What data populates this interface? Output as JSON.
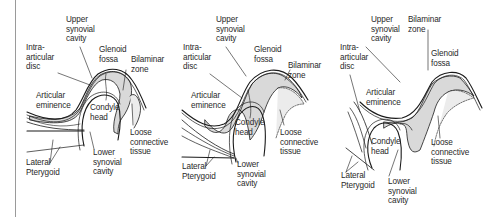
{
  "figure": {
    "panels": [
      {
        "id": "panel-1",
        "labels": [
          {
            "key": "upper_synovial_cavity",
            "lines": [
              "Upper",
              "synovial",
              "cavity"
            ],
            "x": 66,
            "y": 15
          },
          {
            "key": "glenoid_fossa",
            "lines": [
              "Glenoid",
              "fossa"
            ],
            "x": 99,
            "y": 45
          },
          {
            "key": "bilaminar_zone",
            "lines": [
              "Bilaminar",
              "zone"
            ],
            "x": 131,
            "y": 55
          },
          {
            "key": "intra_articular_disc",
            "lines": [
              "Intra-",
              "articular",
              "disc"
            ],
            "x": 26,
            "y": 43
          },
          {
            "key": "articular_eminence",
            "lines": [
              "Articular",
              "eminence"
            ],
            "x": 36,
            "y": 91
          },
          {
            "key": "condyle_head",
            "lines": [
              "Condyle",
              "head"
            ],
            "x": 90,
            "y": 103
          },
          {
            "key": "loose_connective_tissue",
            "lines": [
              "Loose",
              "connective",
              "tissue"
            ],
            "x": 130,
            "y": 128
          },
          {
            "key": "lateral_pterygoid",
            "lines": [
              "Lateral",
              "Pterygoid"
            ],
            "x": 26,
            "y": 158
          },
          {
            "key": "lower_synovial_cavity",
            "lines": [
              "Lower",
              "synovial",
              "cavity"
            ],
            "x": 93,
            "y": 148
          }
        ]
      },
      {
        "id": "panel-2",
        "labels": [
          {
            "key": "upper_synovial_cavity",
            "lines": [
              "Upper",
              "synovial",
              "cavity"
            ],
            "x": 216,
            "y": 15
          },
          {
            "key": "glenoid_fossa",
            "lines": [
              "Glenoid",
              "fossa"
            ],
            "x": 254,
            "y": 45
          },
          {
            "key": "bilaminar_zone",
            "lines": [
              "Bilaminar",
              "zone"
            ],
            "x": 288,
            "y": 61
          },
          {
            "key": "intra_articular_disc",
            "lines": [
              "Intra-",
              "articular",
              "disc"
            ],
            "x": 183,
            "y": 43
          },
          {
            "key": "articular_eminence",
            "lines": [
              "Articular",
              "eminence"
            ],
            "x": 191,
            "y": 91
          },
          {
            "key": "condyle_head",
            "lines": [
              "Condyle",
              "head"
            ],
            "x": 235,
            "y": 118
          },
          {
            "key": "loose_connective_tissue",
            "lines": [
              "Loose",
              "connective",
              "tissue"
            ],
            "x": 280,
            "y": 128
          },
          {
            "key": "lateral_pterygoid",
            "lines": [
              "Lateral",
              "Pterygoid"
            ],
            "x": 182,
            "y": 162
          },
          {
            "key": "lower_synovial_cavity",
            "lines": [
              "Lower",
              "synovial",
              "cavity"
            ],
            "x": 237,
            "y": 160
          }
        ]
      },
      {
        "id": "panel-3",
        "labels": [
          {
            "key": "upper_synovial_cavity",
            "lines": [
              "Upper",
              "synovial",
              "cavity"
            ],
            "x": 371,
            "y": 15
          },
          {
            "key": "bilaminar_zone",
            "lines": [
              "Bilaminar",
              "zone"
            ],
            "x": 408,
            "y": 15
          },
          {
            "key": "glenoid_fossa",
            "lines": [
              "Glenoid",
              "fossa"
            ],
            "x": 431,
            "y": 49
          },
          {
            "key": "intra_articular_disc",
            "lines": [
              "Intra-",
              "articular",
              "disc"
            ],
            "x": 340,
            "y": 43
          },
          {
            "key": "articular_eminence",
            "lines": [
              "Articular",
              "eminence"
            ],
            "x": 366,
            "y": 88
          },
          {
            "key": "condyle_head",
            "lines": [
              "Condyle",
              "head"
            ],
            "x": 371,
            "y": 137
          },
          {
            "key": "loose_connective_tissue",
            "lines": [
              "Loose",
              "connective",
              "tissue"
            ],
            "x": 431,
            "y": 138
          },
          {
            "key": "lateral_pterygoid",
            "lines": [
              "Lateral",
              "Pterygoid"
            ],
            "x": 341,
            "y": 171
          },
          {
            "key": "lower_synovial_cavity",
            "lines": [
              "Lower",
              "synovial",
              "cavity"
            ],
            "x": 388,
            "y": 177
          }
        ]
      }
    ],
    "colors": {
      "background": "#ffffff",
      "line": "#1a1a1a",
      "disc_fill": "#d9d9d9",
      "loose_tissue_fill": "#ececec",
      "text": "#2a2a2a",
      "margin_rule": "#9a9a9a"
    }
  }
}
